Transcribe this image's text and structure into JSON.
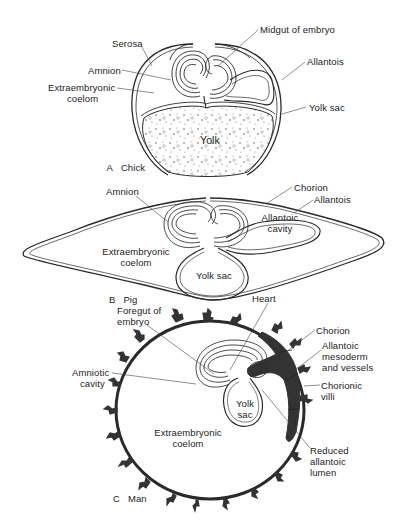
{
  "figure": {
    "panels": [
      {
        "id": "A",
        "name": "Chick",
        "labels": {
          "serosa": "Serosa",
          "midgut": "Midgut of embryo",
          "amnion": "Amnion",
          "allantois": "Allantois",
          "extraembryonic_coelom_1": "Extraembryonic",
          "extraembryonic_coelom_2": "coelom",
          "yolk_sac": "Yolk sac",
          "yolk": "Yolk"
        }
      },
      {
        "id": "B",
        "name": "Pig",
        "labels": {
          "amnion": "Amnion",
          "chorion": "Chorion",
          "allantois": "Allantois",
          "allantoic_cavity_1": "Allantoic",
          "allantoic_cavity_2": "cavity",
          "extraembryonic_coelom_1": "Extraembryonic",
          "extraembryonic_coelom_2": "coelom",
          "yolk_sac": "Yolk sac"
        }
      },
      {
        "id": "C",
        "name": "Man",
        "labels": {
          "heart": "Heart",
          "foregut_1": "Foregut of",
          "foregut_2": "embryo",
          "chorion": "Chorion",
          "allantoic_mesoderm_1": "Allantoic",
          "allantoic_mesoderm_2": "mesoderm",
          "allantoic_mesoderm_3": "and vessels",
          "amniotic_cavity_1": "Amniotic",
          "amniotic_cavity_2": "cavity",
          "chorionic_villi_1": "Chorionic",
          "chorionic_villi_2": "villi",
          "yolk_sac_1": "Yolk",
          "yolk_sac_2": "sac",
          "extraembryonic_coelom_1": "Extraembryonic",
          "extraembryonic_coelom_2": "coelom",
          "reduced_lumen_1": "Reduced",
          "reduced_lumen_2": "allantoic",
          "reduced_lumen_3": "lumen"
        }
      }
    ],
    "colors": {
      "ink": "#2a2a2a",
      "villi": "#333333",
      "background": "#ffffff"
    }
  }
}
